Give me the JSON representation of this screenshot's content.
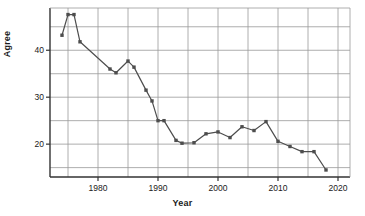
{
  "chart_data": {
    "type": "line",
    "title": "",
    "xlabel": "Year",
    "ylabel": "Agree",
    "xlim": [
      1972,
      2022
    ],
    "ylim": [
      13,
      49
    ],
    "xticks": [
      1980,
      1990,
      2000,
      2010,
      2020
    ],
    "xtick_labels": [
      "1980",
      "1990",
      "2000",
      "2010",
      "2020"
    ],
    "yticks": [
      20,
      30,
      40
    ],
    "ytick_labels": [
      "20",
      "30",
      "40"
    ],
    "grid": true,
    "grid_x_values": [
      1975,
      1980,
      1985,
      1990,
      1995,
      2000,
      2005,
      2010,
      2015,
      2020
    ],
    "grid_y_values": [
      15,
      20,
      25,
      30,
      35,
      40,
      45
    ],
    "legend": "none",
    "marker": "square",
    "line_color": "#4d4d4d",
    "marker_color": "#4d4d4d",
    "grid_color": "#999999",
    "axis_color": "#333333",
    "series": [
      {
        "name": "Agree",
        "x": [
          1974,
          1975,
          1976,
          1977,
          1982,
          1983,
          1985,
          1986,
          1988,
          1989,
          1990,
          1991,
          1993,
          1994,
          1996,
          1998,
          2000,
          2002,
          2004,
          2006,
          2008,
          2010,
          2012,
          2014,
          2016,
          2018
        ],
        "values": [
          43.2,
          47.6,
          47.6,
          41.8,
          36.0,
          35.2,
          37.7,
          36.4,
          31.5,
          29.2,
          25.0,
          25.0,
          20.8,
          20.2,
          20.3,
          22.2,
          22.6,
          21.4,
          23.7,
          22.9,
          24.8,
          20.6,
          19.5,
          18.4,
          18.4,
          14.5
        ]
      }
    ]
  },
  "axes": {
    "ylabel_text": "Agree",
    "xlabel_text": "Year"
  }
}
